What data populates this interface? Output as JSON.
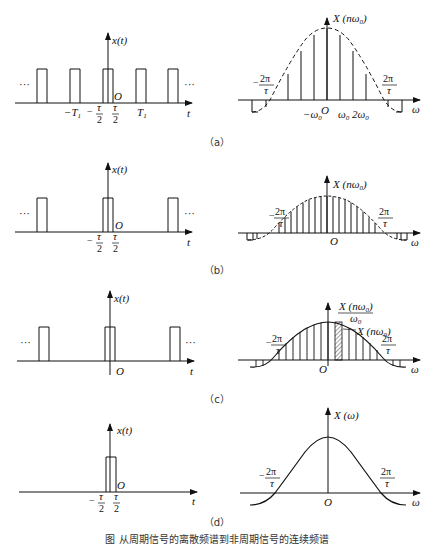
{
  "figure": {
    "caption": "图   从周期信号的离散频谱到非周期信号的连续频谱",
    "panels": [
      {
        "id": "a",
        "label": "（a）",
        "time_domain": {
          "ylabel": "x(t)",
          "xlabel": "t",
          "origin": "O",
          "ticks": [
            "-T1",
            "-τ/2",
            "τ/2",
            "T1"
          ],
          "ellipsis_left": "···",
          "ellipsis_right": "···"
        },
        "freq_domain": {
          "ylabel": "X(nω0)",
          "xlabel": "ω",
          "origin": "O",
          "ticks": [
            "-2π/τ",
            "-ω0",
            "ω0",
            "2ω0",
            "2π/τ"
          ],
          "envelope": "dashed"
        }
      },
      {
        "id": "b",
        "label": "（b）",
        "time_domain": {
          "ylabel": "x(t)",
          "xlabel": "t",
          "origin": "O",
          "ticks": [
            "-τ/2",
            "τ/2"
          ],
          "ellipsis_left": "···",
          "ellipsis_right": "···"
        },
        "freq_domain": {
          "ylabel": "X(nω0)",
          "xlabel": "ω",
          "origin": "O",
          "ticks": [
            "-2π/τ",
            "2π/τ"
          ],
          "envelope": "dashed"
        }
      },
      {
        "id": "c",
        "label": "（c）",
        "time_domain": {
          "ylabel": "x(t)",
          "xlabel": "t",
          "origin": "O",
          "ellipsis_left": "···",
          "ellipsis_right": "···"
        },
        "freq_domain": {
          "ylabel": "X(nω0)/ω0",
          "annotation": "X(nω0)",
          "xlabel": "ω",
          "origin": "O",
          "ticks": [
            "-2π/τ",
            "2π/τ"
          ],
          "envelope": "solid"
        }
      },
      {
        "id": "d",
        "label": "（d）",
        "time_domain": {
          "ylabel": "x(t)",
          "xlabel": "t",
          "origin": "O",
          "ticks": [
            "-τ/2",
            "τ/2"
          ]
        },
        "freq_domain": {
          "ylabel": "X(ω)",
          "xlabel": "ω",
          "origin": "O",
          "ticks": [
            "-2π/τ",
            "2π/τ"
          ],
          "envelope": "solid continuous"
        }
      }
    ]
  },
  "text": {
    "x_t": "x(t)",
    "t": "t",
    "O": "O",
    "omega": "ω",
    "ellipsis": "···",
    "minus": "−",
    "T": "T",
    "one": "1",
    "tau": "τ",
    "two": "2",
    "two_pi": "2π",
    "X_nw0": "X (nω",
    "zero": "0",
    "close_paren": ")",
    "X_w": "X (ω)",
    "neg_w0": "−ω",
    "w0": "ω",
    "two_w0": "2ω",
    "w0_den": "ω",
    "label_a": "（a）",
    "label_b": "（b）",
    "label_c": "（c）",
    "label_d": "（d）"
  }
}
